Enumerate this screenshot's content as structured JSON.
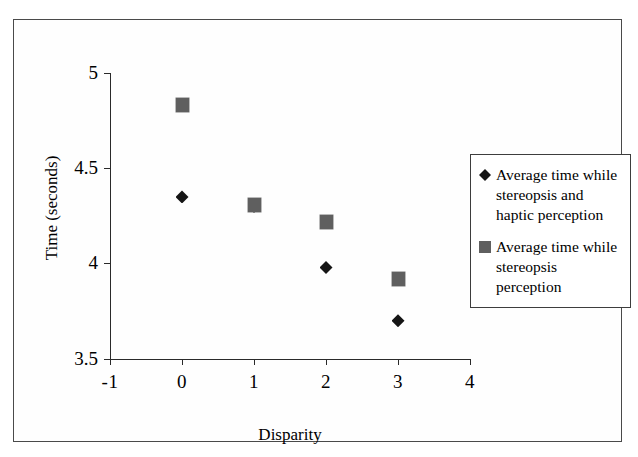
{
  "chart_data": {
    "type": "scatter",
    "title": "",
    "xlabel": "Disparity",
    "ylabel": "Time (seconds)",
    "xlim": [
      -1,
      4
    ],
    "ylim": [
      3.5,
      5
    ],
    "xticks": [
      "-1",
      "0",
      "1",
      "2",
      "3",
      "4"
    ],
    "xtick_values": [
      -1,
      0,
      1,
      2,
      3,
      4
    ],
    "yticks": [
      "3.5",
      "4",
      "4.5",
      "5"
    ],
    "ytick_values": [
      3.5,
      4,
      4.5,
      5
    ],
    "grid": false,
    "legend_position": "right",
    "x": [
      0,
      1,
      2,
      3
    ],
    "series": [
      {
        "name": "Average time while stereopsis and haptic perception",
        "marker": "diamond",
        "color": "#151515",
        "values": [
          4.35,
          4.3,
          3.98,
          3.7
        ]
      },
      {
        "name": "Average time while stereopsis perception",
        "marker": "square",
        "color": "#5f5f5f",
        "values": [
          4.83,
          4.31,
          4.22,
          3.92
        ]
      }
    ]
  },
  "axes": {
    "x_title": "Disparity",
    "y_title": "Time (seconds)",
    "x_tick_labels": [
      "-1",
      "0",
      "1",
      "2",
      "3",
      "4"
    ],
    "y_tick_labels": [
      "5",
      "4.5",
      "4",
      "3.5"
    ]
  },
  "legend": {
    "entries": [
      {
        "marker": "diamond",
        "label": "Average time while stereopsis and haptic perception"
      },
      {
        "marker": "square",
        "label": "Average time while stereopsis perception"
      }
    ]
  },
  "colors": {
    "diamond_series": "#151515",
    "square_series": "#5f5f5f",
    "axis": "#2a2a2a",
    "frame": "#4a4a4a"
  }
}
